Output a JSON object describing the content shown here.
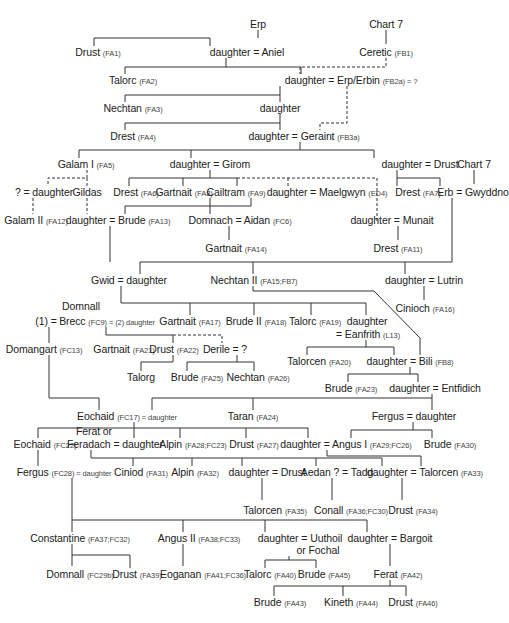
{
  "diagram": {
    "type": "genealogy-tree",
    "nodes": [
      {
        "id": "erp",
        "label": "Erp",
        "ref": "",
        "x": 258,
        "y": 18
      },
      {
        "id": "chart7a",
        "label": "Chart 7",
        "ref": "",
        "x": 386,
        "y": 18
      },
      {
        "id": "drust1",
        "label": "Drust",
        "ref": "(FA1)",
        "x": 98,
        "y": 46
      },
      {
        "id": "aniel",
        "label": "daughter = Aniel",
        "ref": "",
        "x": 247,
        "y": 46
      },
      {
        "id": "ceretic",
        "label": "Ceretic",
        "ref": "(FB1)",
        "x": 386,
        "y": 46
      },
      {
        "id": "talorc2",
        "label": "Talorc",
        "ref": "(FA2)",
        "x": 133,
        "y": 74
      },
      {
        "id": "erbin",
        "label": "daughter = Erp/Erbin",
        "ref": "(FB2a) = ?",
        "x": 351,
        "y": 74
      },
      {
        "id": "nechtan3",
        "label": "Nechtan",
        "ref": "(FA3)",
        "x": 133,
        "y": 102
      },
      {
        "id": "daughter_a",
        "label": "daughter",
        "ref": "",
        "x": 280,
        "y": 102
      },
      {
        "id": "drest4",
        "label": "Drest",
        "ref": "(FA4)",
        "x": 133,
        "y": 130
      },
      {
        "id": "geraint",
        "label": "daughter = Geraint",
        "ref": "(FB3a)",
        "x": 304,
        "y": 130
      },
      {
        "id": "galam1",
        "label": "Galam I",
        "ref": "(FA5)",
        "x": 86,
        "y": 158
      },
      {
        "id": "girom",
        "label": "daughter = Girom",
        "ref": "",
        "x": 210,
        "y": 158
      },
      {
        "id": "drust_dau",
        "label": "daughter = Drust",
        "ref": "",
        "x": 420,
        "y": 158
      },
      {
        "id": "chart7b",
        "label": "Chart 7",
        "ref": "",
        "x": 474,
        "y": 158
      },
      {
        "id": "q_daughter",
        "label": "? = daughter",
        "ref": "",
        "x": 44,
        "y": 186
      },
      {
        "id": "gildas",
        "label": "Gildas",
        "ref": "",
        "x": 87,
        "y": 186
      },
      {
        "id": "drest6",
        "label": "Drest",
        "ref": "(FA6)",
        "x": 136,
        "y": 186
      },
      {
        "id": "gartnait8",
        "label": "Gartnait",
        "ref": "(FA8)",
        "x": 184,
        "y": 186
      },
      {
        "id": "cailtram",
        "label": "Cailtram",
        "ref": "(FA9)",
        "x": 236,
        "y": 186
      },
      {
        "id": "maelgwyn",
        "label": "daughter = Maelgwyn",
        "ref": "(ED4)",
        "x": 327,
        "y": 186
      },
      {
        "id": "drest7",
        "label": "Drest",
        "ref": "(FA7)",
        "x": 418,
        "y": 186
      },
      {
        "id": "gwyddno",
        "label": "Erb = Gwyddno",
        "ref": "",
        "x": 473,
        "y": 186
      },
      {
        "id": "galam2",
        "label": "Galam II",
        "ref": "(FA12)",
        "x": 36,
        "y": 214
      },
      {
        "id": "brude13",
        "label": "daughter = Brude",
        "ref": "(FA13)",
        "x": 118,
        "y": 214
      },
      {
        "id": "aidan",
        "label": "Domnach = Aidan",
        "ref": "(FC6)",
        "x": 240,
        "y": 214
      },
      {
        "id": "munait",
        "label": "daughter = Munait",
        "ref": "",
        "x": 392,
        "y": 214
      },
      {
        "id": "gartnait14",
        "label": "Gartnait",
        "ref": "(FA14)",
        "x": 236,
        "y": 242
      },
      {
        "id": "drest11",
        "label": "Drest",
        "ref": "(FA11)",
        "x": 398,
        "y": 242
      },
      {
        "id": "gwid",
        "label": "Gwid = daughter",
        "ref": "",
        "x": 129,
        "y": 274
      },
      {
        "id": "nechtan2",
        "label": "Nechtan II",
        "ref": "(FA15;FB7)",
        "x": 254,
        "y": 274
      },
      {
        "id": "lutrin",
        "label": "daughter = Lutrin",
        "ref": "",
        "x": 424,
        "y": 274
      },
      {
        "id": "domnall_top",
        "label": "Domnall",
        "ref": "",
        "x": 81,
        "y": 300
      },
      {
        "id": "one_eq",
        "label": "(1) =",
        "ref": "",
        "x": 46,
        "y": 315
      },
      {
        "id": "brecc",
        "label": "Brecc",
        "ref": "(FC9) = (2) daughter",
        "x": 107,
        "y": 315
      },
      {
        "id": "gartnait17",
        "label": "Gartnait",
        "ref": "(FA17)",
        "x": 190,
        "y": 315
      },
      {
        "id": "brude18",
        "label": "Brude II",
        "ref": "(FA18)",
        "x": 256,
        "y": 315
      },
      {
        "id": "talorc19",
        "label": "Talorc",
        "ref": "(FA19)",
        "x": 315,
        "y": 315
      },
      {
        "id": "dau_eanf1",
        "label": "daughter",
        "ref": "",
        "x": 367,
        "y": 315
      },
      {
        "id": "cinioch",
        "label": "Cinioch",
        "ref": "(FA16)",
        "x": 425,
        "y": 302
      },
      {
        "id": "eanfrith",
        "label": "= Eanfrith",
        "ref": "(L13)",
        "x": 368,
        "y": 328
      },
      {
        "id": "domangart",
        "label": "Domangart",
        "ref": "(FC13)",
        "x": 44,
        "y": 343
      },
      {
        "id": "gartnait21",
        "label": "Gartnait",
        "ref": "(FA21)",
        "x": 124,
        "y": 343
      },
      {
        "id": "drust22",
        "label": "Drust",
        "ref": "(FA22)",
        "x": 174,
        "y": 343
      },
      {
        "id": "derile",
        "label": "Derile = ?",
        "ref": "",
        "x": 225,
        "y": 343
      },
      {
        "id": "talorcen20",
        "label": "Talorcen",
        "ref": "(FA20)",
        "x": 319,
        "y": 355
      },
      {
        "id": "bili",
        "label": "daughter = Bili",
        "ref": "(FB8)",
        "x": 410,
        "y": 355
      },
      {
        "id": "talorg",
        "label": "Talorg",
        "ref": "",
        "x": 141,
        "y": 371
      },
      {
        "id": "brude25",
        "label": "Brude",
        "ref": "(FA25)",
        "x": 197,
        "y": 371
      },
      {
        "id": "nechtan26",
        "label": "Nechtan",
        "ref": "(FA26)",
        "x": 258,
        "y": 371
      },
      {
        "id": "brude23",
        "label": "Brude",
        "ref": "(FA23)",
        "x": 351,
        "y": 382
      },
      {
        "id": "entfidich",
        "label": "daughter = Entfidich",
        "ref": "",
        "x": 435,
        "y": 382
      },
      {
        "id": "eochaid17",
        "label": "Eochaid",
        "ref": "(FC17) = daughter",
        "x": 127,
        "y": 410
      },
      {
        "id": "taran",
        "label": "Taran",
        "ref": "(FA24)",
        "x": 253,
        "y": 410
      },
      {
        "id": "fergus",
        "label": "Fergus = daughter",
        "ref": "",
        "x": 414,
        "y": 410
      },
      {
        "id": "ferat_or",
        "label": "Ferat or",
        "ref": "",
        "x": 94,
        "y": 425
      },
      {
        "id": "eochaid22",
        "label": "Eochaid",
        "ref": "(FC22)",
        "x": 45,
        "y": 438
      },
      {
        "id": "feradach",
        "label": "Feradach = daughter",
        "ref": "",
        "x": 115,
        "y": 438
      },
      {
        "id": "alpin28",
        "label": "Alpin",
        "ref": "(FA28;FC23)",
        "x": 193,
        "y": 438
      },
      {
        "id": "drust27",
        "label": "Drust",
        "ref": "(FA27)",
        "x": 254,
        "y": 438
      },
      {
        "id": "angus1",
        "label": "daughter = Angus I",
        "ref": "(FA29;FC26)",
        "x": 346,
        "y": 438
      },
      {
        "id": "brude30",
        "label": "Brude",
        "ref": "(FA30)",
        "x": 450,
        "y": 438
      },
      {
        "id": "fergus28",
        "label": "Fergus",
        "ref": "(FC28) = daughter",
        "x": 64,
        "y": 466
      },
      {
        "id": "ciniod",
        "label": "Ciniod",
        "ref": "(FA31)",
        "x": 141,
        "y": 466
      },
      {
        "id": "alpin32",
        "label": "Alpin",
        "ref": "(FA32)",
        "x": 195,
        "y": 466
      },
      {
        "id": "dau_drust",
        "label": "daughter = Drust",
        "ref": "",
        "x": 267,
        "y": 466
      },
      {
        "id": "tadg",
        "label": "Aedan ? = Tadg",
        "ref": "",
        "x": 337,
        "y": 466
      },
      {
        "id": "talorcen33",
        "label": "daughter = Talorcen",
        "ref": "(FA33)",
        "x": 425,
        "y": 466
      },
      {
        "id": "talorcen35",
        "label": "Talorcen",
        "ref": "(FA35)",
        "x": 275,
        "y": 504
      },
      {
        "id": "conall",
        "label": "Conall",
        "ref": "(FA36;FC30)",
        "x": 351,
        "y": 504
      },
      {
        "id": "drust34",
        "label": "Drust",
        "ref": "(FA34)",
        "x": 413,
        "y": 504
      },
      {
        "id": "constantine",
        "label": "Constantine",
        "ref": "(FA37;FC32)",
        "x": 80,
        "y": 532
      },
      {
        "id": "angus2",
        "label": "Angus II",
        "ref": "(FA38;FC33)",
        "x": 199,
        "y": 532
      },
      {
        "id": "uuthoil",
        "label": "daughter = Uuthoil",
        "ref": "",
        "x": 300,
        "y": 532
      },
      {
        "id": "fochal",
        "label": "or Fochal",
        "ref": "",
        "x": 318,
        "y": 544
      },
      {
        "id": "bargoit",
        "label": "daughter = Bargoit",
        "ref": "",
        "x": 390,
        "y": 532
      },
      {
        "id": "domnall29",
        "label": "Domnall",
        "ref": "(FC29b)",
        "x": 80,
        "y": 568
      },
      {
        "id": "drust39",
        "label": "Drust",
        "ref": "(FA39)",
        "x": 137,
        "y": 568
      },
      {
        "id": "eoganan",
        "label": "Eoganan",
        "ref": "(FA41;FC36)",
        "x": 203,
        "y": 568
      },
      {
        "id": "talorc40",
        "label": "Talorc",
        "ref": "(FA40)",
        "x": 270,
        "y": 568
      },
      {
        "id": "brude45",
        "label": "Brude",
        "ref": "(FA45)",
        "x": 324,
        "y": 568
      },
      {
        "id": "ferat42",
        "label": "Ferat",
        "ref": "(FA42)",
        "x": 398,
        "y": 568
      },
      {
        "id": "brude43",
        "label": "Brude",
        "ref": "(FA43)",
        "x": 280,
        "y": 596
      },
      {
        "id": "kineth",
        "label": "Kineth",
        "ref": "(FA44)",
        "x": 351,
        "y": 596
      },
      {
        "id": "drust46",
        "label": "Drust",
        "ref": "(FA46)",
        "x": 413,
        "y": 596
      }
    ]
  }
}
